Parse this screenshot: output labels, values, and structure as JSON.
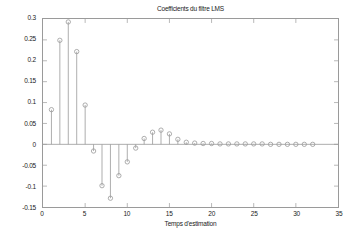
{
  "figure": {
    "background_color": "#ffffff",
    "axes_color": "#9a9a9a",
    "data_color": "#999999"
  },
  "chart_data": {
    "type": "scatter",
    "plot_style": "stem",
    "title": "Coefficients du filtre LMS",
    "xlabel": "Temps d'estimation",
    "ylabel": "",
    "xlim": [
      0,
      35
    ],
    "ylim": [
      -0.15,
      0.3
    ],
    "xticks": [
      0,
      5,
      10,
      15,
      20,
      25,
      30,
      35
    ],
    "xtick_labels": [
      "0",
      "5",
      "10",
      "15",
      "20",
      "25",
      "30",
      "35"
    ],
    "yticks": [
      -0.15,
      -0.1,
      -0.05,
      0,
      0.05,
      0.1,
      0.15,
      0.2,
      0.25,
      0.3
    ],
    "ytick_labels": [
      "-0.15",
      "-0.1",
      "-0.05",
      "0",
      "0.05",
      "0.1",
      "0.15",
      "0.2",
      "0.25",
      "0.3"
    ],
    "grid": false,
    "legend": null,
    "marker": "circle",
    "baseline": 0,
    "x": [
      1,
      2,
      3,
      4,
      5,
      6,
      7,
      8,
      9,
      10,
      11,
      12,
      13,
      14,
      15,
      16,
      17,
      18,
      19,
      20,
      21,
      22,
      23,
      24,
      25,
      26,
      27,
      28,
      29,
      30,
      31,
      32
    ],
    "values": [
      0.083,
      0.249,
      0.293,
      0.222,
      0.094,
      -0.016,
      -0.099,
      -0.129,
      -0.075,
      -0.042,
      -0.009,
      0.014,
      0.029,
      0.034,
      0.025,
      0.012,
      0.005,
      0.003,
      0.002,
      0.002,
      0.001,
      0.001,
      0.001,
      0.001,
      0.001,
      0.001,
      0.0,
      0.0,
      0.0,
      0.0,
      0.0,
      0.0
    ],
    "series": [
      {
        "name": "Coefficients du filtre LMS",
        "values": [
          0.083,
          0.249,
          0.293,
          0.222,
          0.094,
          -0.016,
          -0.099,
          -0.129,
          -0.075,
          -0.042,
          -0.009,
          0.014,
          0.029,
          0.034,
          0.025,
          0.012,
          0.005,
          0.003,
          0.002,
          0.002,
          0.001,
          0.001,
          0.001,
          0.001,
          0.001,
          0.001,
          0.0,
          0.0,
          0.0,
          0.0,
          0.0,
          0.0
        ]
      }
    ]
  }
}
